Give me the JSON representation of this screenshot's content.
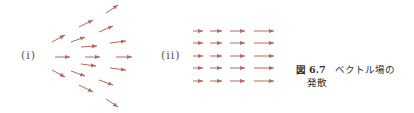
{
  "figure": {
    "panels": [
      {
        "label": "(i)",
        "description": "diverging vector field",
        "arrows": [
          {
            "x1": 106,
            "y1": 13,
            "x2": 118,
            "y2": 5
          },
          {
            "x1": 79,
            "y1": 27,
            "x2": 93,
            "y2": 20
          },
          {
            "x1": 99,
            "y1": 32,
            "x2": 113,
            "y2": 26
          },
          {
            "x1": 52,
            "y1": 42,
            "x2": 65,
            "y2": 35
          },
          {
            "x1": 71,
            "y1": 42,
            "x2": 85,
            "y2": 37
          },
          {
            "x1": 110,
            "y1": 43,
            "x2": 126,
            "y2": 41
          },
          {
            "x1": 81,
            "y1": 47,
            "x2": 97,
            "y2": 46
          },
          {
            "x1": 55,
            "y1": 57,
            "x2": 70,
            "y2": 57
          },
          {
            "x1": 85,
            "y1": 57,
            "x2": 100,
            "y2": 57
          },
          {
            "x1": 116,
            "y1": 57,
            "x2": 132,
            "y2": 57
          },
          {
            "x1": 81,
            "y1": 64,
            "x2": 96,
            "y2": 66
          },
          {
            "x1": 110,
            "y1": 68,
            "x2": 126,
            "y2": 70
          },
          {
            "x1": 52,
            "y1": 70,
            "x2": 65,
            "y2": 77
          },
          {
            "x1": 71,
            "y1": 71,
            "x2": 85,
            "y2": 76
          },
          {
            "x1": 99,
            "y1": 80,
            "x2": 113,
            "y2": 85
          },
          {
            "x1": 79,
            "y1": 85,
            "x2": 93,
            "y2": 92
          },
          {
            "x1": 106,
            "y1": 99,
            "x2": 118,
            "y2": 107
          }
        ]
      },
      {
        "label": "(ii)",
        "description": "parallel vector field with increasing magnitude",
        "rows_y": [
          31,
          43,
          56,
          68,
          81
        ],
        "columns": [
          {
            "x1": 193,
            "x2": 203
          },
          {
            "x1": 210,
            "x2": 222
          },
          {
            "x1": 230,
            "x2": 245
          },
          {
            "x1": 254,
            "x2": 274
          }
        ]
      }
    ],
    "arrow_color": "#b5695a",
    "caption": {
      "prefix": "図",
      "number": "6.7",
      "line1_text": "ベクトル場の",
      "line2_text": "発散"
    }
  }
}
